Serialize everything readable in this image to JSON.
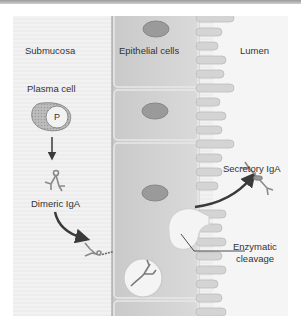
{
  "diagram": {
    "type": "biological-schematic",
    "title": "",
    "regions": {
      "submucosa": "Submucosa",
      "epithelium": "Epithelial cells",
      "lumen": "Lumen"
    },
    "labels": {
      "plasma_cell": "Plasma cell",
      "plasma_nucleus": "P",
      "dimeric_iga": "Dimeric IgA",
      "secretory_iga": "Secretory IgA",
      "enzymatic_line1": "Enzymatic",
      "enzymatic_line2": "cleavage"
    },
    "colors": {
      "background": "#f0f0f0",
      "cell_fill": "#d2d2d2",
      "nucleus_fill": "#9a9a9a",
      "arrow": "#3a3a3a",
      "text": "#333333"
    }
  }
}
